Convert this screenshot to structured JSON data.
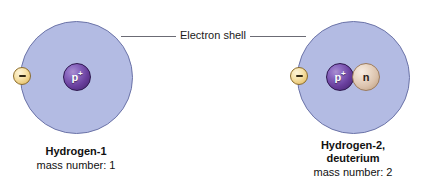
{
  "figure": {
    "background_color": "#ffffff"
  },
  "callout": {
    "label": "Electron shell",
    "line_color": "#6b6b74"
  },
  "colors": {
    "shell_fill": "#b3bbe3",
    "shell_stroke": "#6c74a8",
    "proton": "#6a3f9e",
    "neutron": "#dcc3ad",
    "electron": "#e8c573",
    "text": "#111111"
  },
  "atoms": [
    {
      "id": "hydrogen-1",
      "name": "Hydrogen-1",
      "name_line_2": "",
      "mass_label": "mass number: 1",
      "proton_label": "p",
      "proton_charge": "+",
      "neutron_label": "",
      "electron_charge": "−",
      "proton_count": 1,
      "neutron_count": 0,
      "electron_count": 1
    },
    {
      "id": "hydrogen-2",
      "name": "Hydrogen-2,",
      "name_line_2": "deuterium",
      "mass_label": "mass number: 2",
      "proton_label": "p",
      "proton_charge": "+",
      "neutron_label": "n",
      "electron_charge": "−",
      "proton_count": 1,
      "neutron_count": 1,
      "electron_count": 1
    }
  ]
}
